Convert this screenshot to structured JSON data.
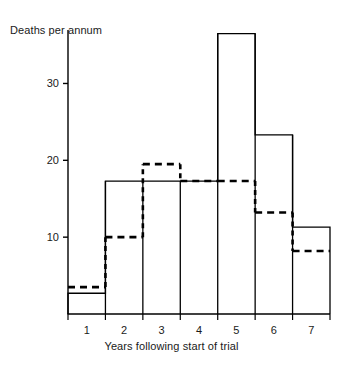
{
  "chart_data": {
    "type": "bar",
    "title": "",
    "xlabel": "Years following start of trial",
    "ylabel": "Deaths per annum",
    "categories": [
      "1",
      "2",
      "3",
      "4",
      "5",
      "6",
      "7"
    ],
    "xtick_labels": [
      "1",
      "2",
      "3",
      "4",
      "5",
      "6",
      "7"
    ],
    "ytick_labels": [
      "10",
      "20",
      "30"
    ],
    "yticks": [
      10,
      20,
      30
    ],
    "ylim": [
      0,
      38
    ],
    "xlim": [
      0,
      7
    ],
    "grid": false,
    "legend": "none",
    "series": [
      {
        "name": "observed",
        "style": "solid-histogram",
        "color": "#000000",
        "values": [
          2.7,
          17.3,
          17.3,
          17.3,
          36.5,
          23.3,
          11.3
        ]
      },
      {
        "name": "expected",
        "style": "dashed-step",
        "color": "#000000",
        "values": [
          3.5,
          10.0,
          19.5,
          17.3,
          17.3,
          13.2,
          8.2
        ]
      }
    ]
  }
}
